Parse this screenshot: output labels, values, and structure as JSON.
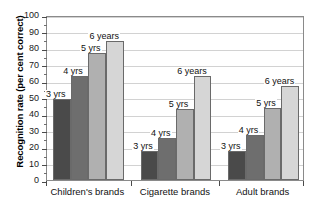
{
  "chart_data": {
    "type": "bar",
    "title": "",
    "xlabel": "",
    "ylabel": "Recognition rate (per cent correct)",
    "ylim": [
      0,
      100
    ],
    "ytick_step": 10,
    "yticks": [
      0,
      10,
      20,
      30,
      40,
      50,
      60,
      70,
      80,
      90,
      100
    ],
    "grid": true,
    "legend_position": "none",
    "categories": [
      "Children's brands",
      "Cigarette brands",
      "Adult brands"
    ],
    "series": [
      {
        "name": "3 yrs",
        "label": "3 yrs",
        "color": "#4a4a4a",
        "values": [
          49,
          17.5,
          17.5
        ]
      },
      {
        "name": "4 yrs",
        "label": "4 yrs",
        "color": "#6e6e6e",
        "values": [
          63,
          25.5,
          27
        ]
      },
      {
        "name": "5 yrs",
        "label": "5 yrs",
        "color": "#b0b0b0",
        "values": [
          77,
          43,
          43.5
        ]
      },
      {
        "name": "6 years",
        "label": "6 years",
        "color": "#d6d6d6",
        "values": [
          84,
          63,
          57
        ]
      }
    ],
    "bar_labels": [
      [
        "3 yrs",
        "4 yrs",
        "5 yrs",
        "6 years"
      ],
      [
        "3 yrs",
        "4 yrs",
        "5 yrs",
        "6 years"
      ],
      [
        "3 yrs",
        "4 yrs",
        "5 yrs",
        "6 years"
      ]
    ],
    "axis_color": "#8a8a8a",
    "grid_color": "#d2d2d2",
    "background": "#ffffff"
  }
}
